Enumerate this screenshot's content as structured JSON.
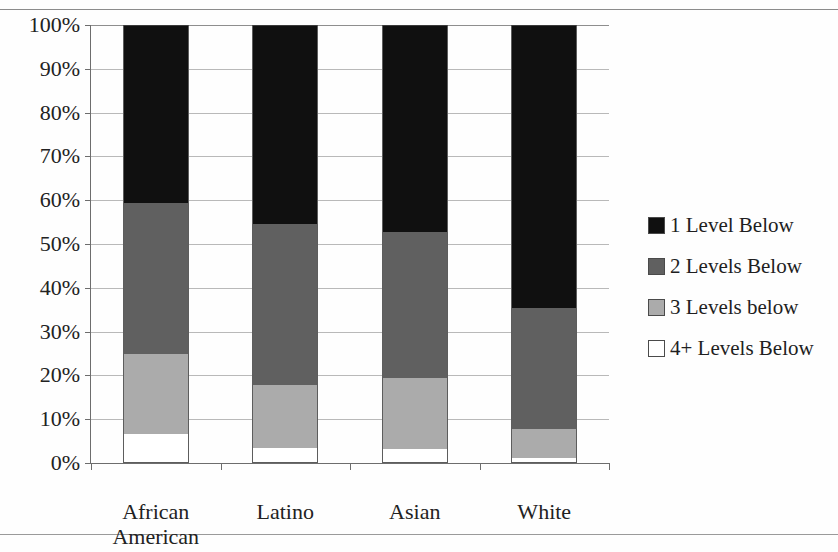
{
  "page": {
    "clipped_caption_fragment": "",
    "background_color": "#fefefe"
  },
  "chart_data": {
    "type": "bar",
    "subtype": "stacked-bar-100-percent",
    "title": "",
    "xlabel": "",
    "ylabel": "",
    "ylim": [
      0,
      100
    ],
    "ytick_labels": [
      "100%",
      "90%",
      "80%",
      "70%",
      "60%",
      "50%",
      "40%",
      "30%",
      "20%",
      "10%",
      "0%"
    ],
    "ytick_values": [
      100,
      90,
      80,
      70,
      60,
      50,
      40,
      30,
      20,
      10,
      0
    ],
    "grid": true,
    "legend_position": "right",
    "categories": [
      "African American",
      "Latino",
      "Asian",
      "White"
    ],
    "category_lines": [
      [
        "African",
        "American"
      ],
      [
        "Latino"
      ],
      [
        "Asian"
      ],
      [
        "White"
      ]
    ],
    "series": [
      {
        "name": "1 Level Below",
        "color": "#101010",
        "values": [
          40.6,
          45.4,
          47.3,
          64.6
        ]
      },
      {
        "name": "2 Levels Below",
        "color": "#606060",
        "values": [
          34.5,
          36.8,
          33.3,
          27.6
        ]
      },
      {
        "name": "3 Levels below",
        "color": "#ababab",
        "values": [
          18.3,
          14.4,
          16.2,
          6.7
        ]
      },
      {
        "name": "4+ Levels Below",
        "color": "#ffffff",
        "values": [
          6.6,
          3.4,
          3.2,
          1.1
        ]
      }
    ],
    "cumulative_tops": {
      "African American": {
        "4+ Levels Below": 6.6,
        "3 Levels below": 24.9,
        "2 Levels Below": 59.4,
        "1 Level Below": 100
      },
      "Latino": {
        "4+ Levels Below": 3.4,
        "3 Levels below": 17.8,
        "2 Levels Below": 54.6,
        "1 Level Below": 100
      },
      "Asian": {
        "4+ Levels Below": 3.2,
        "3 Levels below": 19.4,
        "2 Levels Below": 52.7,
        "1 Level Below": 100
      },
      "White": {
        "4+ Levels Below": 1.1,
        "3 Levels below": 7.8,
        "2 Levels Below": 35.4,
        "1 Level Below": 100
      }
    }
  },
  "legend": {
    "items": [
      {
        "label": "1 Level Below",
        "color": "#101010"
      },
      {
        "label": "2 Levels Below",
        "color": "#606060"
      },
      {
        "label": "3 Levels below",
        "color": "#ababab"
      },
      {
        "label": "4+ Levels Below",
        "color": "#ffffff"
      }
    ]
  },
  "colors": {
    "axis": "#6d6d6d",
    "grid": "#b9b9b9",
    "text": "#222222",
    "rule": "#8b8b8b"
  }
}
